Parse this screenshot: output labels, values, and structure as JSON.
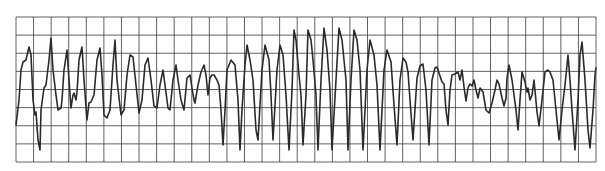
{
  "figure": {
    "type": "ecg-rhythm-strip",
    "grid": {
      "left": 16,
      "top": 17,
      "right": 596,
      "bottom": 162,
      "cols": 33,
      "rows": 8,
      "line_color": "#3a3a3a",
      "background": "#ffffff"
    },
    "trace": {
      "color": "#2a2a2a",
      "width": 1.6,
      "points": [
        [
          16,
          125
        ],
        [
          19,
          100
        ],
        [
          21,
          70
        ],
        [
          23,
          62
        ],
        [
          26,
          60
        ],
        [
          29,
          47
        ],
        [
          31,
          55
        ],
        [
          33,
          100
        ],
        [
          35,
          115
        ],
        [
          36,
          112
        ],
        [
          38,
          140
        ],
        [
          40,
          150
        ],
        [
          41,
          110
        ],
        [
          44,
          88
        ],
        [
          46,
          85
        ],
        [
          49,
          60
        ],
        [
          51,
          38
        ],
        [
          53,
          70
        ],
        [
          56,
          95
        ],
        [
          58,
          110
        ],
        [
          61,
          108
        ],
        [
          62,
          100
        ],
        [
          64,
          70
        ],
        [
          67,
          50
        ],
        [
          69,
          80
        ],
        [
          71,
          108
        ],
        [
          73,
          95
        ],
        [
          74,
          93
        ],
        [
          76,
          100
        ],
        [
          77,
          92
        ],
        [
          79,
          60
        ],
        [
          82,
          47
        ],
        [
          84,
          80
        ],
        [
          87,
          120
        ],
        [
          89,
          103
        ],
        [
          91,
          102
        ],
        [
          94,
          95
        ],
        [
          97,
          60
        ],
        [
          100,
          48
        ],
        [
          102,
          75
        ],
        [
          104,
          115
        ],
        [
          107,
          118
        ],
        [
          110,
          110
        ],
        [
          113,
          65
        ],
        [
          115,
          40
        ],
        [
          117,
          80
        ],
        [
          121,
          115
        ],
        [
          124,
          110
        ],
        [
          127,
          75
        ],
        [
          130,
          55
        ],
        [
          133,
          57
        ],
        [
          136,
          85
        ],
        [
          139,
          113
        ],
        [
          142,
          100
        ],
        [
          145,
          65
        ],
        [
          148,
          58
        ],
        [
          151,
          80
        ],
        [
          154,
          106
        ],
        [
          157,
          108
        ],
        [
          160,
          85
        ],
        [
          163,
          70
        ],
        [
          165,
          85
        ],
        [
          168,
          108
        ],
        [
          170,
          110
        ],
        [
          173,
          80
        ],
        [
          176,
          65
        ],
        [
          178,
          80
        ],
        [
          181,
          100
        ],
        [
          184,
          110
        ],
        [
          187,
          78
        ],
        [
          190,
          75
        ],
        [
          192,
          88
        ],
        [
          194,
          100
        ],
        [
          195,
          103
        ],
        [
          198,
          85
        ],
        [
          201,
          72
        ],
        [
          204,
          65
        ],
        [
          206,
          75
        ],
        [
          208,
          95
        ],
        [
          210,
          78
        ],
        [
          212,
          75
        ],
        [
          214,
          75
        ],
        [
          217,
          80
        ],
        [
          219,
          85
        ],
        [
          221,
          110
        ],
        [
          223,
          145
        ],
        [
          225,
          110
        ],
        [
          227,
          70
        ],
        [
          231,
          60
        ],
        [
          235,
          65
        ],
        [
          238,
          100
        ],
        [
          240,
          150
        ],
        [
          242,
          110
        ],
        [
          245,
          65
        ],
        [
          247,
          45
        ],
        [
          250,
          60
        ],
        [
          253,
          80
        ],
        [
          256,
          130
        ],
        [
          258,
          140
        ],
        [
          262,
          70
        ],
        [
          265,
          45
        ],
        [
          269,
          60
        ],
        [
          271,
          95
        ],
        [
          273,
          140
        ],
        [
          277,
          70
        ],
        [
          280,
          45
        ],
        [
          283,
          55
        ],
        [
          286,
          95
        ],
        [
          289,
          150
        ],
        [
          292,
          90
        ],
        [
          294,
          30
        ],
        [
          296,
          40
        ],
        [
          299,
          75
        ],
        [
          301,
          95
        ],
        [
          303,
          145
        ],
        [
          306,
          95
        ],
        [
          308,
          30
        ],
        [
          311,
          40
        ],
        [
          313,
          60
        ],
        [
          316,
          95
        ],
        [
          318,
          150
        ],
        [
          321,
          80
        ],
        [
          324,
          28
        ],
        [
          327,
          50
        ],
        [
          330,
          90
        ],
        [
          332,
          150
        ],
        [
          336,
          80
        ],
        [
          339,
          28
        ],
        [
          342,
          40
        ],
        [
          346,
          80
        ],
        [
          348,
          150
        ],
        [
          351,
          80
        ],
        [
          354,
          30
        ],
        [
          357,
          40
        ],
        [
          360,
          70
        ],
        [
          363,
          150
        ],
        [
          367,
          70
        ],
        [
          370,
          40
        ],
        [
          374,
          55
        ],
        [
          377,
          85
        ],
        [
          380,
          150
        ],
        [
          384,
          70
        ],
        [
          387,
          50
        ],
        [
          391,
          62
        ],
        [
          394,
          105
        ],
        [
          397,
          145
        ],
        [
          400,
          80
        ],
        [
          403,
          58
        ],
        [
          406,
          62
        ],
        [
          408,
          72
        ],
        [
          410,
          100
        ],
        [
          413,
          140
        ],
        [
          417,
          78
        ],
        [
          420,
          66
        ],
        [
          423,
          64
        ],
        [
          426,
          90
        ],
        [
          429,
          145
        ],
        [
          432,
          80
        ],
        [
          435,
          68
        ],
        [
          437,
          67
        ],
        [
          440,
          76
        ],
        [
          442,
          82
        ],
        [
          444,
          84
        ],
        [
          446,
          110
        ],
        [
          448,
          125
        ],
        [
          450,
          90
        ],
        [
          452,
          75
        ],
        [
          455,
          74
        ],
        [
          458,
          72
        ],
        [
          460,
          80
        ],
        [
          462,
          70
        ],
        [
          464,
          87
        ],
        [
          466,
          101
        ],
        [
          468,
          88
        ],
        [
          470,
          84
        ],
        [
          472,
          86
        ],
        [
          474,
          80
        ],
        [
          476,
          90
        ],
        [
          478,
          98
        ],
        [
          480,
          88
        ],
        [
          483,
          92
        ],
        [
          486,
          110
        ],
        [
          489,
          113
        ],
        [
          492,
          103
        ],
        [
          495,
          90
        ],
        [
          497,
          80
        ],
        [
          499,
          84
        ],
        [
          502,
          98
        ],
        [
          504,
          106
        ],
        [
          506,
          98
        ],
        [
          507,
          78
        ],
        [
          509,
          65
        ],
        [
          512,
          80
        ],
        [
          514,
          95
        ],
        [
          516,
          110
        ],
        [
          518,
          130
        ],
        [
          520,
          100
        ],
        [
          522,
          72
        ],
        [
          525,
          82
        ],
        [
          527,
          92
        ],
        [
          528,
          88
        ],
        [
          530,
          100
        ],
        [
          532,
          95
        ],
        [
          534,
          80
        ],
        [
          537,
          112
        ],
        [
          539,
          126
        ],
        [
          542,
          100
        ],
        [
          545,
          72
        ],
        [
          548,
          70
        ],
        [
          550,
          72
        ],
        [
          553,
          80
        ],
        [
          556,
          110
        ],
        [
          559,
          140
        ],
        [
          562,
          110
        ],
        [
          565,
          85
        ],
        [
          568,
          55
        ],
        [
          570,
          80
        ],
        [
          572,
          110
        ],
        [
          575,
          150
        ],
        [
          578,
          100
        ],
        [
          580,
          55
        ],
        [
          582,
          42
        ],
        [
          585,
          80
        ],
        [
          588,
          130
        ],
        [
          590,
          148
        ],
        [
          593,
          110
        ],
        [
          595,
          75
        ],
        [
          596,
          68
        ]
      ]
    }
  }
}
